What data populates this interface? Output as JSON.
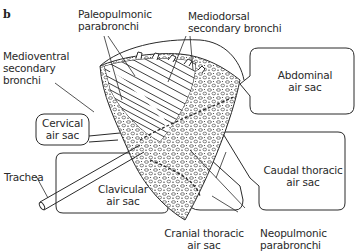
{
  "figure": {
    "panel_letter": "b"
  },
  "labels": {
    "paleopulmonic": [
      "Paleopulmonic",
      "parabronchi"
    ],
    "mediodorsal": [
      "Mediodorsal",
      "secondary bronchi"
    ],
    "medioventral": [
      "Medioventral",
      "secondary",
      "bronchi"
    ],
    "cervical": [
      "Cervical",
      "air sac"
    ],
    "abdominal": [
      "Abdominal",
      "air sac"
    ],
    "trachea": "Trachea",
    "clavicular": [
      "Clavicular",
      "air sac"
    ],
    "caudal_thoracic": [
      "Caudal thoracic",
      "air sac"
    ],
    "cranial_thoracic": [
      "Cranial thoracic",
      "air sac"
    ],
    "neopulmonic": [
      "Neopulmonic",
      "parabronchi"
    ]
  },
  "colors": {
    "ink": "#2a2a2a",
    "background": "#ffffff"
  }
}
